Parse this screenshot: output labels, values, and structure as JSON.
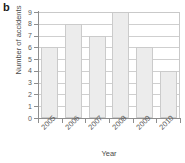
{
  "panel": {
    "label": "b"
  },
  "chart_data": {
    "type": "bar",
    "title": "",
    "subtitle": "",
    "categories": [
      "2005",
      "2006",
      "2007",
      "2008",
      "2009",
      "2010"
    ],
    "values": [
      6,
      8,
      7,
      9,
      6,
      4
    ],
    "series": [
      {
        "name": "Number of accidents",
        "values": [
          6,
          8,
          7,
          9,
          6,
          4
        ]
      }
    ],
    "xlabel": "Year",
    "ylabel": "Number of accidents",
    "ylim": [
      0,
      9
    ],
    "yticks": [
      0,
      1,
      2,
      3,
      4,
      5,
      6,
      7,
      8,
      9
    ],
    "ytick_labels": [
      "0",
      "1",
      "2",
      "3",
      "4",
      "5",
      "6",
      "7",
      "8",
      "9"
    ],
    "grid": "horizontal",
    "legend": "none",
    "annotations": [],
    "colors": {
      "bar_fill": "#ececec",
      "bar_edge": "#cbcbcb",
      "axis": "#8e8e8e",
      "grid": "#cfcfcf",
      "text": "#4a4a4a"
    }
  }
}
